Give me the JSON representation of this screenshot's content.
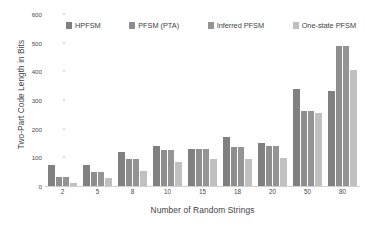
{
  "chart_data": {
    "type": "bar",
    "title": "",
    "xlabel": "Number of Random Strings",
    "ylabel": "Two-Part Code Length in Bits",
    "categories": [
      "2",
      "5",
      "8",
      "10",
      "15",
      "18",
      "20",
      "50",
      "80"
    ],
    "ylim": [
      0,
      600
    ],
    "yticks": [
      0,
      100,
      200,
      300,
      400,
      500,
      600
    ],
    "grid": false,
    "legend_position": "top",
    "series": [
      {
        "name": "HPFSM",
        "color": "#808080",
        "values": [
          75,
          75,
          120,
          140,
          130,
          170,
          150,
          340,
          330
        ]
      },
      {
        "name": "PFSM (PTA)",
        "color": "#8e8e8e",
        "values": [
          30,
          50,
          95,
          125,
          130,
          135,
          140,
          260,
          490
        ]
      },
      {
        "name": "Inferred PFSM",
        "color": "#949494",
        "values": [
          30,
          50,
          95,
          125,
          130,
          135,
          140,
          260,
          490
        ]
      },
      {
        "name": "One-state PFSM",
        "color": "#c0c0c0",
        "values": [
          12,
          28,
          52,
          85,
          95,
          95,
          98,
          255,
          405
        ]
      }
    ]
  }
}
